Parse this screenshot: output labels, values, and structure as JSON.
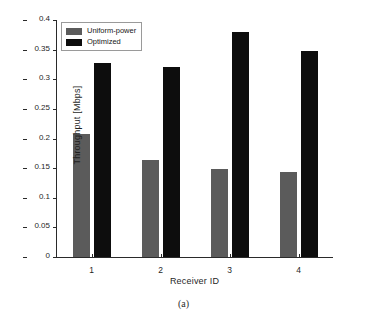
{
  "caption": "(a)",
  "legend": {
    "position": "top-left",
    "entries": [
      {
        "label": "Uniform-power",
        "color": "#5b5b5b",
        "swatch": "uniform-power-swatch"
      },
      {
        "label": "Optimized",
        "color": "#0d0d0d",
        "swatch": "optimized-swatch"
      }
    ]
  },
  "chart_data": {
    "type": "bar",
    "title": "",
    "subtitle": "",
    "xlabel": "Receiver ID",
    "ylabel": "Throughput [Mbps]",
    "categories": [
      "1",
      "2",
      "3",
      "4"
    ],
    "series": [
      {
        "name": "Uniform-power",
        "color": "#5b5b5b",
        "values": [
          0.208,
          0.164,
          0.148,
          0.143
        ]
      },
      {
        "name": "Optimized",
        "color": "#0d0d0d",
        "values": [
          0.328,
          0.321,
          0.379,
          0.347
        ]
      }
    ],
    "ylim": [
      0,
      0.4
    ],
    "yticks": [
      0,
      0.05,
      0.1,
      0.15,
      0.2,
      0.25,
      0.3,
      0.35,
      0.4
    ],
    "ytick_labels": [
      "0",
      "0.05",
      "0.1",
      "0.15",
      "0.2",
      "0.25",
      "0.3",
      "0.35",
      "0.4"
    ],
    "xticks": [
      1,
      2,
      3,
      4
    ],
    "xtick_labels": [
      "1",
      "2",
      "3",
      "4"
    ],
    "grid": false,
    "legend_position": "upper left"
  }
}
